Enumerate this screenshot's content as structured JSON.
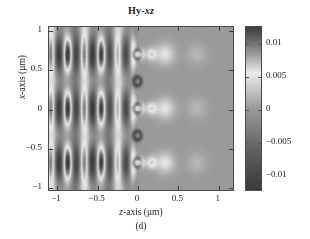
{
  "figure": {
    "title_main": "Hy-",
    "title_italic": "xz",
    "caption": "(d)"
  },
  "axes": {
    "xlabel_main": "-axis (μm)",
    "xlabel_italic": "z",
    "ylabel_main": "-axis (μm)",
    "ylabel_italic": "x",
    "xticks": [
      "−1",
      "−0.5",
      "0",
      "0.5",
      "1"
    ],
    "xtick_values": [
      -1,
      -0.5,
      0,
      0.5,
      1
    ],
    "yticks": [
      "1",
      "0.5",
      "0",
      "−0.5",
      "−1"
    ],
    "ytick_values": [
      1,
      0.5,
      0,
      -0.5,
      -1
    ]
  },
  "colorbar": {
    "ticks": [
      "0.01",
      "0.005",
      "0",
      "−0.005",
      "−0.01"
    ],
    "tick_values": [
      0.01,
      0.005,
      0,
      -0.005,
      -0.01
    ],
    "high_color": "#3a3a3a",
    "mid_color": "#ededed",
    "low_color": "#3a3a3a",
    "background_color": "#9a9a9a"
  },
  "chart_data": {
    "type": "heatmap",
    "title": "Hy-xz",
    "xlabel": "z-axis (μm)",
    "ylabel": "x-axis (μm)",
    "xlim": [
      -1.1,
      1.2
    ],
    "ylim": [
      -1.05,
      1.05
    ],
    "clim": [
      -0.0125,
      0.0125
    ],
    "colormap": "gray",
    "colorbar_ticks": [
      -0.01,
      -0.005,
      0,
      0.005,
      0.01
    ],
    "grid": false,
    "legend": "none",
    "annotation": "(d)",
    "standing_wave": {
      "z_range": [
        -1.0,
        -0.02
      ],
      "z_period": 0.21,
      "x_period": 0.7,
      "peak_amplitude": 0.0115
    },
    "focal_spots": [
      {
        "z": 0.04,
        "x": 0.7,
        "amplitude": 0.011
      },
      {
        "z": 0.18,
        "x": 0.7,
        "amplitude": 0.006
      },
      {
        "z": 0.35,
        "x": 0.7,
        "amplitude": 0.005
      },
      {
        "z": 0.75,
        "x": 0.7,
        "amplitude": 0.002
      },
      {
        "z": 0.04,
        "x": 0.0,
        "amplitude": 0.011
      },
      {
        "z": 0.18,
        "x": 0.0,
        "amplitude": 0.006
      },
      {
        "z": 0.35,
        "x": 0.0,
        "amplitude": 0.005
      },
      {
        "z": 0.75,
        "x": 0.0,
        "amplitude": 0.002
      },
      {
        "z": 0.04,
        "x": -0.7,
        "amplitude": 0.011
      },
      {
        "z": 0.18,
        "x": -0.7,
        "amplitude": 0.006
      },
      {
        "z": 0.35,
        "x": -0.7,
        "amplitude": 0.005
      },
      {
        "z": 0.75,
        "x": -0.7,
        "amplitude": 0.002
      }
    ],
    "apertures": [
      {
        "z": 0.0,
        "x": 0.7
      },
      {
        "z": 0.0,
        "x": 0.35
      },
      {
        "z": 0.0,
        "x": 0.0
      },
      {
        "z": 0.0,
        "x": -0.35
      },
      {
        "z": 0.0,
        "x": -0.7
      }
    ]
  }
}
